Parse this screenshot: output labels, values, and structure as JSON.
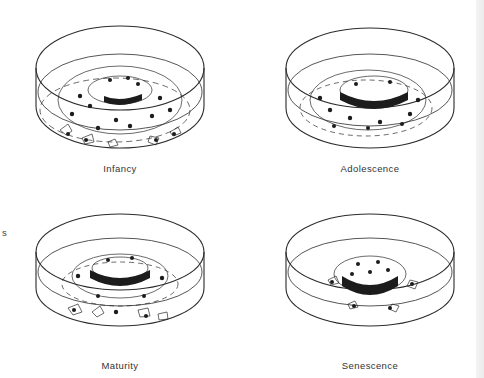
{
  "figure": {
    "panels": [
      {
        "id": "infancy",
        "label": "Infancy"
      },
      {
        "id": "adolescence",
        "label": "Adolescence"
      },
      {
        "id": "maturity",
        "label": "Maturity"
      },
      {
        "id": "senescence",
        "label": "Senescence"
      }
    ],
    "cutoff_text": "s",
    "colors": {
      "line": "#2b2b2b",
      "fill": "#1c1c1c",
      "background": "#ffffff"
    }
  }
}
